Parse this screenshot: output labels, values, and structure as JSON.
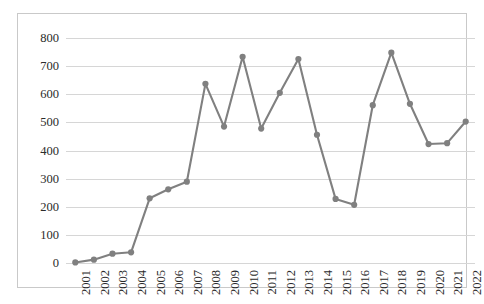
{
  "chart_data": {
    "type": "line",
    "title": "",
    "subtitle": "",
    "xlabel": "",
    "ylabel": "",
    "categories": [
      "2001",
      "2002",
      "2003",
      "2004",
      "2005",
      "2006",
      "2007",
      "2008",
      "2009",
      "2010",
      "2011",
      "2012",
      "2013",
      "2014",
      "2015",
      "2016",
      "2017",
      "2018",
      "2019",
      "2020",
      "2021",
      "2022"
    ],
    "values": [
      2,
      12,
      33,
      38,
      230,
      262,
      289,
      637,
      485,
      733,
      478,
      605,
      725,
      456,
      228,
      207,
      561,
      748,
      566,
      423,
      426,
      503
    ],
    "series": [
      {
        "name": "",
        "values": [
          2,
          12,
          33,
          38,
          230,
          262,
          289,
          637,
          485,
          733,
          478,
          605,
          725,
          456,
          228,
          207,
          561,
          748,
          566,
          423,
          426,
          503
        ]
      }
    ],
    "ylim": [
      0,
      800
    ],
    "ytick_labels": [
      "0",
      "100",
      "200",
      "300",
      "400",
      "500",
      "600",
      "700",
      "800"
    ],
    "ytick_values": [
      0,
      100,
      200,
      300,
      400,
      500,
      600,
      700,
      800
    ],
    "ytick_step": 100,
    "grid": {
      "horizontal": true,
      "vertical": false
    },
    "legend": {
      "visible": false,
      "position": "none",
      "entries": []
    },
    "annotations": [],
    "xtick_rotation_degrees": 90,
    "marker": "circle",
    "colors": {
      "line": "#808080",
      "marker": "#808080",
      "gridline": "#d6d6d6",
      "plot_border": "#c9c9c9",
      "background": "#ffffff",
      "tick_label": "#2b2b2b"
    }
  }
}
